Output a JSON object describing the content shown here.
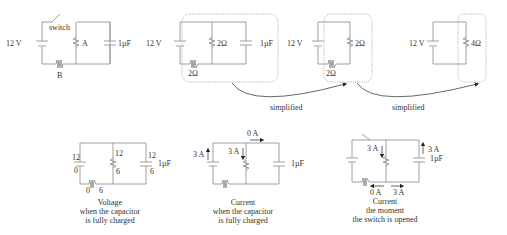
{
  "top": {
    "circuit1": {
      "battery": "12 V",
      "switch": "switch",
      "resistor_a": "A",
      "resistor_b": "B",
      "capacitor": "1µF"
    },
    "circuit2": {
      "battery": "12 V",
      "resistor_parallel": "2Ω",
      "resistor_series": "2Ω",
      "capacitor": "1µF"
    },
    "circuit3": {
      "battery": "12 V",
      "resistor_parallel": "2Ω",
      "resistor_series": "2Ω"
    },
    "circuit4": {
      "battery": "12 V",
      "resistor": "4Ω"
    },
    "arrows": [
      {
        "label": "simplified"
      },
      {
        "label": "simplified"
      }
    ]
  },
  "bottom": {
    "voltage": {
      "battery_top": "12",
      "battery_bottom": "0",
      "resistor_top": "12",
      "resistor_bottom": "6",
      "cap_top": "12",
      "cap_bottom": "6",
      "cap_label": "1µF",
      "series_left": "0",
      "series_right": "6",
      "caption": [
        "Voltage",
        "when the capacitor",
        "is fully charged"
      ]
    },
    "current_charged": {
      "battery_current": "3 A",
      "resistor_current": "3 A",
      "cap_branch_current": "0 A",
      "cap_label": "1µF",
      "caption": [
        "Current",
        "when the capacitor",
        "is fully charged"
      ]
    },
    "current_opened": {
      "resistor_current": "3 A",
      "cap_current": "3 A",
      "cap_label": "1µF",
      "series_current": "0 A",
      "bottom_current": "3 A",
      "caption": [
        "Current",
        "the moment",
        "the switch is opened"
      ]
    }
  }
}
